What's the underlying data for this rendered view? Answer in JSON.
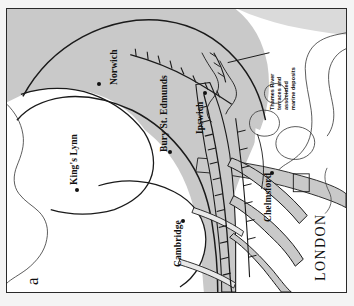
{
  "figure": {
    "panel_label": "a",
    "caption_subject": "Quaternary geology of East Anglia and the Thames estuary",
    "orientation_note": "map printed rotated 90 degrees counter-clockwise"
  },
  "map": {
    "title": "East Anglia glacial deposits and Thames river terraces",
    "annotation": {
      "text_lines": [
        "Thames River",
        "terraces and",
        "associated",
        "marine deposits"
      ],
      "full_text": "Thames River terraces and associated marine deposits"
    },
    "region_label": "LONDON",
    "cities": [
      {
        "name": "Norwich",
        "x": 92,
        "y": 76,
        "label_x": 105,
        "label_y": 74,
        "rotation": -90
      },
      {
        "name": "King's Lynn",
        "x": 70,
        "y": 181,
        "label_x": 64,
        "label_y": 175,
        "rotation": -90
      },
      {
        "name": "Bury St. Edmunds",
        "x": 163,
        "y": 143,
        "label_x": 155,
        "label_y": 137,
        "rotation": -90
      },
      {
        "name": "Ipswich",
        "x": 198,
        "y": 84,
        "label_x": 191,
        "label_y": 95,
        "rotation": -90
      },
      {
        "name": "Chelmsford",
        "x": 268,
        "y": 165,
        "label_x": 260,
        "label_y": 160,
        "rotation": -90
      },
      {
        "name": "Cambridge",
        "x": 176,
        "y": 212,
        "label_x": 168,
        "label_y": 207,
        "rotation": -90
      }
    ],
    "legend_units": [
      {
        "key": "till_shaded",
        "label": "Glacial till / shaded deposits",
        "color": "#c8c8c8"
      },
      {
        "key": "chalk_white",
        "label": "Chalk and older bedrock",
        "color": "#ffffff"
      },
      {
        "key": "terrace_gray",
        "label": "Thames terrace gravels",
        "color": "#c8c8c8"
      }
    ],
    "colors": {
      "shaded_fill": "#c9c9c9",
      "shaded_fill_light": "#d6d6d6",
      "white_fill": "#ffffff",
      "line": "#1a1a1a",
      "frame": "#2a2a2a",
      "page": "#f4f4f4"
    },
    "symbols": {
      "moraine_ticks": "barbed tick marks along ice-margin / valley lines",
      "city_marker": "filled circle"
    }
  }
}
